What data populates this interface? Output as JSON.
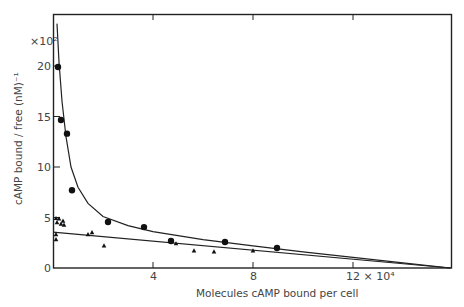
{
  "chart_data": {
    "type": "scatter",
    "title": "",
    "xlabel": "Molecules cAMP bound per cell",
    "ylabel": "cAMP bound / free (nM)⁻¹",
    "x_multiplier_label": "12 × 10⁴",
    "y_multiplier_label": "×10²",
    "xlim": [
      0,
      15.9
    ],
    "ylim": [
      0,
      24
    ],
    "x_ticks": [
      {
        "value": 4,
        "label": "4"
      },
      {
        "value": 8,
        "label": "8"
      },
      {
        "value": 12,
        "label": "12 × 10⁴"
      }
    ],
    "y_ticks": [
      {
        "value": 0,
        "label": "0"
      },
      {
        "value": 5,
        "label": "5"
      },
      {
        "value": 10,
        "label": "10"
      },
      {
        "value": 15,
        "label": "15"
      },
      {
        "value": 20,
        "label": "20"
      }
    ],
    "grid": false,
    "legend": null,
    "series": [
      {
        "name": "circles",
        "marker": "circle",
        "points": [
          [
            0.2,
            19.9
          ],
          [
            0.32,
            14.65
          ],
          [
            0.56,
            13.3
          ],
          [
            0.76,
            7.7
          ],
          [
            2.2,
            4.55
          ],
          [
            3.64,
            4.05
          ],
          [
            4.72,
            2.67
          ],
          [
            6.88,
            2.57
          ],
          [
            8.96,
            1.98
          ]
        ]
      },
      {
        "name": "triangles",
        "marker": "triangle",
        "points": [
          [
            0.12,
            4.9
          ],
          [
            0.16,
            4.5
          ],
          [
            0.24,
            4.85
          ],
          [
            0.32,
            4.35
          ],
          [
            0.4,
            4.65
          ],
          [
            0.44,
            4.25
          ],
          [
            0.12,
            3.3
          ],
          [
            0.12,
            2.8
          ],
          [
            1.4,
            3.3
          ],
          [
            1.56,
            3.5
          ],
          [
            2.04,
            2.2
          ],
          [
            4.92,
            2.4
          ],
          [
            5.64,
            1.7
          ],
          [
            6.44,
            1.6
          ],
          [
            8.0,
            1.7
          ]
        ]
      }
    ],
    "fit_lines": [
      {
        "name": "upper curve (biphasic fit)",
        "points": [
          [
            0.16,
            24.2
          ],
          [
            0.24,
            20.4
          ],
          [
            0.36,
            16.5
          ],
          [
            0.52,
            13.0
          ],
          [
            0.72,
            10.0
          ],
          [
            1.0,
            8.0
          ],
          [
            1.4,
            6.4
          ],
          [
            2.0,
            5.1
          ],
          [
            3.0,
            4.2
          ],
          [
            4.0,
            3.6
          ],
          [
            6.0,
            2.8
          ],
          [
            8.0,
            2.2
          ],
          [
            10.0,
            1.6
          ],
          [
            12.0,
            1.05
          ],
          [
            14.0,
            0.5
          ],
          [
            15.9,
            0
          ]
        ]
      },
      {
        "name": "lower line (linear fit)",
        "points": [
          [
            0,
            3.55
          ],
          [
            15.9,
            0
          ]
        ]
      }
    ]
  }
}
